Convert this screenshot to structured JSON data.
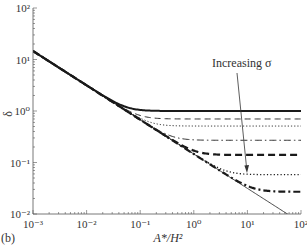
{
  "figure": {
    "panel_label": "(b)",
    "annotation": "Increasing σ"
  },
  "chart_data": {
    "type": "line",
    "title": "",
    "panel_label": "(b)",
    "xlabel": "A*/H²",
    "ylabel": "δ",
    "xscale": "log",
    "yscale": "log",
    "xlim": [
      0.001,
      100
    ],
    "ylim": [
      0.01,
      100
    ],
    "xticks": [
      "10⁻³",
      "10⁻²",
      "10⁻¹",
      "10⁰",
      "10¹",
      "10²"
    ],
    "yticks": [
      "10⁻²",
      "10⁻¹",
      "10⁰",
      "10¹",
      "10²"
    ],
    "grid": false,
    "legend": null,
    "annotations": [
      {
        "text": "Increasing σ",
        "type": "arrow",
        "from": [
          4.5,
          0.6
        ],
        "to": [
          9,
          0.06
        ]
      }
    ],
    "asymptote": {
      "name": "asymptote (thin solid)",
      "style": "thin-solid",
      "formula": "δ = 0.146 · (A*/H²)^(-2/3)",
      "coef": 0.146,
      "exponent": -0.6667
    },
    "x": [
      0.001,
      0.00178,
      0.00316,
      0.00562,
      0.01,
      0.0178,
      0.0316,
      0.0562,
      0.1,
      0.178,
      0.316,
      0.562,
      1,
      1.78,
      3.16,
      5.62,
      10,
      17.8,
      31.6,
      56.2,
      100
    ],
    "series": [
      {
        "name": "σ1",
        "style": "thick-solid",
        "plateau": 1.0,
        "values": [
          14.6,
          9.95,
          6.78,
          4.62,
          3.15,
          2.16,
          1.55,
          1.19,
          1.05,
          1.01,
          1.0,
          1.0,
          1.0,
          1.0,
          1.0,
          1.0,
          1.0,
          1.0,
          1.0,
          1.0,
          1.0
        ]
      },
      {
        "name": "σ2",
        "style": "thin-dash",
        "plateau": 0.7,
        "values": [
          14.6,
          9.95,
          6.78,
          4.62,
          3.15,
          2.14,
          1.48,
          1.07,
          0.82,
          0.73,
          0.71,
          0.7,
          0.7,
          0.7,
          0.7,
          0.7,
          0.7,
          0.7,
          0.7,
          0.7,
          0.7
        ]
      },
      {
        "name": "σ3",
        "style": "thin-dot",
        "plateau": 0.51,
        "values": [
          14.6,
          9.95,
          6.78,
          4.62,
          3.15,
          2.14,
          1.46,
          1.02,
          0.72,
          0.56,
          0.52,
          0.51,
          0.51,
          0.51,
          0.51,
          0.51,
          0.51,
          0.51,
          0.51,
          0.51,
          0.51
        ]
      },
      {
        "name": "σ4",
        "style": "thin-dash-dot",
        "plateau": 0.27,
        "values": [
          14.6,
          9.95,
          6.78,
          4.62,
          3.15,
          2.14,
          1.46,
          1.0,
          0.68,
          0.47,
          0.34,
          0.29,
          0.27,
          0.27,
          0.27,
          0.27,
          0.27,
          0.27,
          0.27,
          0.27,
          0.27
        ]
      },
      {
        "name": "σ5",
        "style": "thick-dash",
        "plateau": 0.14,
        "values": [
          14.6,
          9.95,
          6.78,
          4.62,
          3.15,
          2.14,
          1.46,
          1.0,
          0.68,
          0.46,
          0.32,
          0.23,
          0.17,
          0.15,
          0.14,
          0.14,
          0.14,
          0.14,
          0.14,
          0.14,
          0.14
        ]
      },
      {
        "name": "σ6",
        "style": "dotted",
        "plateau": 0.058,
        "values": [
          14.6,
          9.95,
          6.78,
          4.62,
          3.15,
          2.14,
          1.46,
          1.0,
          0.68,
          0.46,
          0.32,
          0.21,
          0.15,
          0.1,
          0.072,
          0.062,
          0.059,
          0.058,
          0.058,
          0.058,
          0.058
        ]
      },
      {
        "name": "σ7",
        "style": "thick-dash-dot",
        "plateau": 0.027,
        "values": [
          14.6,
          9.95,
          6.78,
          4.62,
          3.15,
          2.14,
          1.46,
          1.0,
          0.68,
          0.46,
          0.32,
          0.21,
          0.15,
          0.1,
          0.068,
          0.048,
          0.036,
          0.03,
          0.028,
          0.027,
          0.027
        ]
      }
    ]
  },
  "colors": {
    "line": "#1a1a1a",
    "axis": "#555555",
    "text": "#333333",
    "background": "#ffffff"
  }
}
